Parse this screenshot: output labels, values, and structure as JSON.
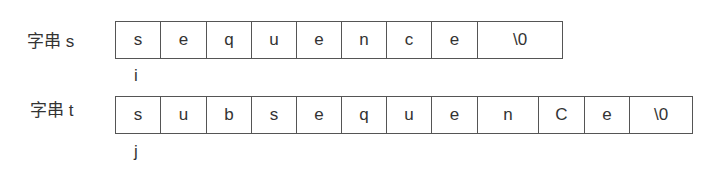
{
  "strings": [
    {
      "label": "字串 s",
      "pointer": "i",
      "cells": [
        "s",
        "e",
        "q",
        "u",
        "e",
        "n",
        "c",
        "e",
        "\\0"
      ],
      "widths": [
        45,
        46,
        45,
        45,
        45,
        45,
        45,
        46,
        85
      ]
    },
    {
      "label": "字串 t",
      "pointer": "j",
      "cells": [
        "s",
        "u",
        "b",
        "s",
        "e",
        "q",
        "u",
        "e",
        "n",
        "C",
        "e",
        "\\0"
      ],
      "widths": [
        45,
        46,
        45,
        45,
        45,
        45,
        45,
        46,
        61,
        46,
        45,
        63
      ]
    }
  ]
}
